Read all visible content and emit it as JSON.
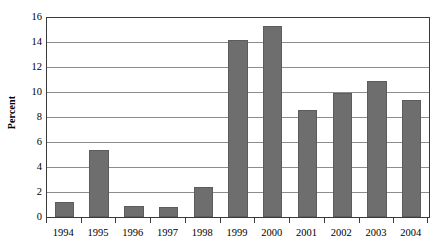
{
  "chart_data": {
    "type": "bar",
    "title": "",
    "subtitle": "",
    "xlabel": "",
    "ylabel": "Percent",
    "categories": [
      "1994",
      "1995",
      "1996",
      "1997",
      "1998",
      "1999",
      "2000",
      "2001",
      "2002",
      "2003",
      "2004"
    ],
    "values": [
      1.2,
      5.4,
      0.9,
      0.8,
      2.4,
      14.2,
      15.3,
      8.6,
      9.9,
      10.9,
      9.4
    ],
    "ylim": [
      0,
      16
    ],
    "ytick_labels": [
      "0",
      "2",
      "4",
      "6",
      "8",
      "10",
      "12",
      "14",
      "16"
    ],
    "ytick_values": [
      0,
      2,
      4,
      6,
      8,
      10,
      12,
      14,
      16
    ],
    "ystep": 2,
    "grid": true,
    "grid_axis": "y",
    "legend": false,
    "legend_position": "none",
    "bar_color": "#6e6e6e",
    "grid_color": "#8c8c8c",
    "axis_color": "#3a3a3a",
    "background_color": "#ffffff",
    "text_color": "#000000",
    "annotations": []
  }
}
